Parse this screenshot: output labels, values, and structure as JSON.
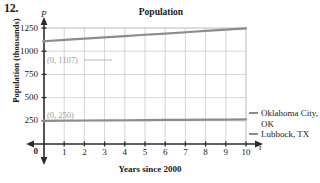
{
  "problem": {
    "number": "12."
  },
  "chart_data": {
    "type": "line",
    "title": "Population",
    "xlabel": "Years since 2000",
    "ylabel": "Population (thousands)",
    "x_axis_variable": "t",
    "y_axis_variable": "P",
    "xlim": [
      0,
      10
    ],
    "ylim": [
      0,
      1250
    ],
    "grid": true,
    "legend_position": "right",
    "x_ticks": [
      "0",
      "1",
      "2",
      "3",
      "4",
      "5",
      "6",
      "7",
      "8",
      "9",
      "10"
    ],
    "y_ticks": [
      "0",
      "250",
      "500",
      "750",
      "1000",
      "1250"
    ],
    "x": [
      0,
      1,
      2,
      3,
      4,
      5,
      6,
      7,
      8,
      9,
      10
    ],
    "series": [
      {
        "name": "Oklahoma City, OK",
        "color": "#8c8c8c",
        "values": [
          1107,
          1121,
          1135,
          1149,
          1163,
          1177,
          1190,
          1204,
          1218,
          1232,
          1246
        ]
      },
      {
        "name": "Lubbock, TX",
        "color": "#8c8c8c",
        "values": [
          250,
          251,
          253,
          254,
          256,
          257,
          259,
          260,
          262,
          263,
          265
        ]
      }
    ],
    "annotations": [
      {
        "text": "(0, 1107)",
        "x": 0,
        "y": 1107,
        "color": "#9a9a9a"
      },
      {
        "text": "(0, 250)",
        "x": 0,
        "y": 250,
        "color": "#9a9a9a"
      }
    ]
  },
  "legend": {
    "items": [
      {
        "label": "Oklahoma City, OK"
      },
      {
        "label": "Lubbock, TX"
      }
    ]
  },
  "colors": {
    "axis": "#2b2b2b",
    "grid": "#c9c9c9",
    "series": "#8c8c8c",
    "annotation": "#9a9a9a"
  }
}
